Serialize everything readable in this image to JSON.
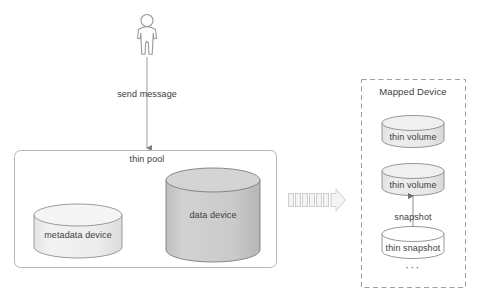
{
  "diagram": {
    "background_color": "#ffffff",
    "actor": {
      "name": "user-actor",
      "shape": "stick-figure-outline",
      "stroke_color": "#9a9a9a"
    },
    "flow_label": "send message",
    "thin_pool": {
      "label": "thin pool",
      "border_color": "#b5b5b5",
      "fill_color": "#ffffff",
      "devices": [
        {
          "label": "metadata device",
          "shape": "cylinder",
          "fill_color": "#ededed",
          "stroke_color": "#8f8f8f"
        },
        {
          "label": "data device",
          "shape": "cylinder",
          "fill_color": "#c9c9c9",
          "stroke_color": "#7d7d7d"
        }
      ]
    },
    "transfer_arrow": {
      "name": "segmented-block-arrow",
      "segments": 7,
      "fill_color": "#f2f2f2",
      "stroke_color": "#c4c4c4"
    },
    "mapped_device": {
      "label": "Mapped Device",
      "border_style": "dashed",
      "border_color": "#9e9e9e",
      "items": [
        {
          "label": "thin volume",
          "shape": "cylinder",
          "fill_color": "#e9e9e9",
          "stroke_color": "#8a8a8a"
        },
        {
          "label": "thin volume",
          "shape": "cylinder",
          "fill_color": "#e9e9e9",
          "stroke_color": "#8a8a8a"
        },
        {
          "label": "thin snapshot",
          "shape": "cylinder",
          "fill_color": "#ffffff",
          "stroke_color": "#8a8a8a"
        }
      ],
      "relation_label": "snapshot",
      "continuation": "···"
    },
    "colors": {
      "line": "#9a9a9a",
      "text": "#3d3d3d",
      "box_border": "#b5b5b5",
      "dashed_border": "#9e9e9e"
    }
  }
}
